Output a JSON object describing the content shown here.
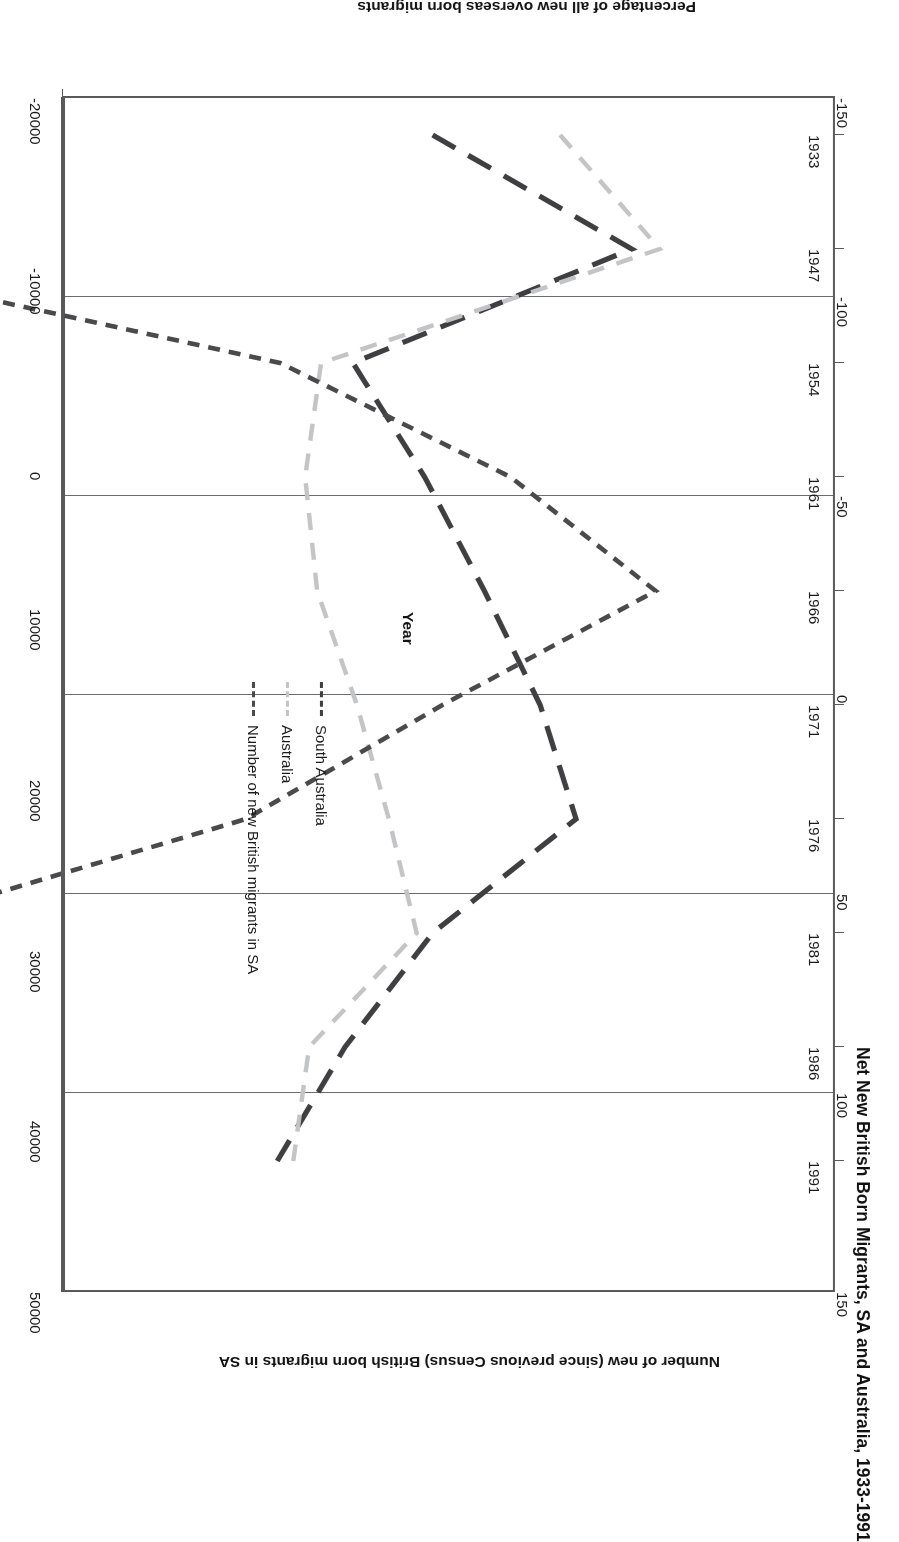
{
  "chart_data": {
    "type": "line",
    "title": "Net New British Born Migrants, SA and Australia, 1933-1991",
    "xlabel": "Year",
    "ylabel": "Percentage of all new overseas born migrants",
    "y2label": "Number of new (since previous Census) British born migrants in SA",
    "categories": [
      "1933",
      "1947",
      "1954",
      "1961",
      "1966",
      "1971",
      "1976",
      "1981",
      "1986",
      "1991"
    ],
    "ylim": [
      -150,
      150
    ],
    "yticks": [
      "-150",
      "-100",
      "-50",
      "0",
      "50",
      "100",
      "150"
    ],
    "y2lim": [
      -20000,
      50000
    ],
    "y2ticks": [
      "-20000",
      "-10000",
      "0",
      "10000",
      "20000",
      "30000",
      "40000",
      "50000"
    ],
    "grid": true,
    "legend_position": "inside-center",
    "series": [
      {
        "name": "South Australia",
        "axis": "left",
        "color": "#3f3f42",
        "dash": "long-dash",
        "values": [
          49,
          99,
          29,
          47,
          62,
          76,
          85,
          49,
          27,
          10
        ]
      },
      {
        "name": "Australia",
        "axis": "left",
        "color": "#c3c4c6",
        "dash": "dash",
        "values": [
          81,
          106,
          21,
          17,
          20,
          30,
          38,
          45,
          18,
          14
        ]
      },
      {
        "name": "Number of new British migrants in SA",
        "axis": "right",
        "color": "#4a4a4d",
        "dash": "short-dash",
        "values": [
          -9500,
          -13000,
          17500,
          31000,
          39500,
          27000,
          15500,
          -7000,
          -8000,
          -4500
        ]
      }
    ]
  },
  "legend": {
    "items": [
      {
        "label": "South Australia"
      },
      {
        "label": "Australia"
      },
      {
        "label": "Number of new British migrants in SA"
      }
    ]
  }
}
